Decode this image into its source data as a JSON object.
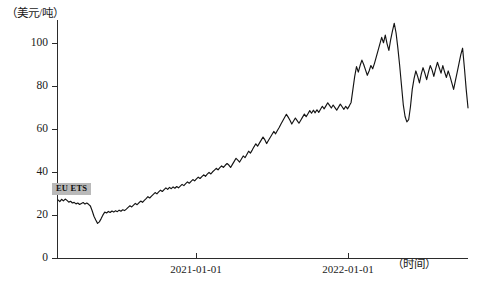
{
  "chart_data": {
    "type": "line",
    "title": "",
    "subtitle": "",
    "xlabel": "（时间）",
    "ylabel": "（美元/吨）",
    "grid": false,
    "legend_position": "inline-label",
    "series_label": "EU ETS",
    "ylim": [
      0,
      110
    ],
    "yticks": [
      0,
      20,
      40,
      60,
      80,
      100
    ],
    "ytick_labels": [
      "0",
      "20",
      "40",
      "60",
      "80",
      "100"
    ],
    "xlim": [
      "2020-07-01",
      "2022-10-15"
    ],
    "xticks": [
      "2021-01-01",
      "2022-01-01"
    ],
    "xtick_labels": [
      "2021-01-01",
      "2022-01-01"
    ],
    "colors": {
      "line": "#141414",
      "axis": "#2b2b2b",
      "badge_background": "#b9b9b9",
      "background": "#ffffff"
    },
    "series": [
      {
        "name": "EU ETS",
        "x": [
          0,
          1,
          2,
          3,
          4,
          5,
          6,
          7,
          8,
          9,
          10,
          11,
          12,
          13,
          14,
          15,
          16,
          17,
          18,
          19,
          20,
          21,
          22,
          23,
          24,
          25,
          26,
          27,
          28,
          29,
          30,
          31,
          32,
          33,
          34,
          35,
          36,
          37,
          38,
          39,
          40,
          41,
          42,
          43,
          44,
          45,
          46,
          47,
          48,
          49,
          50,
          51,
          52,
          53,
          54,
          55,
          56,
          57,
          58,
          59,
          60,
          61,
          62,
          63,
          64,
          65,
          66,
          67,
          68,
          69,
          70,
          71,
          72,
          73,
          74,
          75,
          76,
          77,
          78,
          79,
          80,
          81,
          82,
          83,
          84,
          85,
          86,
          87,
          88,
          89,
          90,
          91,
          92,
          93,
          94,
          95,
          96,
          97,
          98,
          99,
          100,
          101,
          102,
          103,
          104,
          105,
          106,
          107,
          108,
          109,
          110,
          111,
          112,
          113,
          114,
          115,
          116,
          117,
          118,
          119,
          120,
          121,
          122,
          123,
          124,
          125,
          126,
          127,
          128,
          129,
          130,
          131,
          132,
          133,
          134,
          135,
          136,
          137,
          138,
          139,
          140,
          141,
          142,
          143,
          144,
          145,
          146,
          147,
          148,
          149,
          150,
          151,
          152,
          153,
          154,
          155,
          156,
          157,
          158,
          159,
          160,
          161,
          162,
          163,
          164,
          165,
          166,
          167,
          168,
          169,
          170,
          171,
          172,
          173,
          174,
          175,
          176,
          177,
          178,
          179,
          180,
          181,
          182,
          183,
          184,
          185,
          186,
          187,
          188,
          189,
          190,
          191,
          192,
          193,
          194,
          195
        ],
        "values": [
          27.0,
          26.2,
          27.3,
          26.6,
          27.4,
          26.8,
          26.0,
          26.4,
          25.6,
          25.9,
          25.2,
          25.6,
          24.9,
          25.4,
          25.8,
          25.1,
          25.6,
          25.0,
          24.2,
          22.0,
          19.5,
          17.8,
          16.2,
          16.9,
          18.4,
          20.1,
          21.4,
          21.0,
          21.7,
          21.2,
          21.9,
          21.4,
          22.0,
          21.6,
          22.3,
          21.8,
          22.5,
          22.1,
          22.8,
          23.6,
          24.3,
          23.8,
          24.6,
          25.4,
          24.8,
          25.7,
          26.5,
          25.9,
          26.8,
          27.6,
          28.5,
          27.9,
          28.8,
          29.6,
          30.4,
          29.8,
          30.7,
          31.5,
          30.9,
          31.8,
          32.6,
          31.9,
          32.8,
          32.2,
          33.0,
          32.4,
          33.2,
          32.6,
          33.4,
          34.2,
          33.6,
          34.5,
          35.3,
          34.7,
          35.6,
          36.4,
          35.8,
          36.7,
          37.5,
          36.9,
          37.8,
          38.6,
          37.9,
          38.9,
          39.7,
          39.0,
          40.0,
          40.8,
          41.6,
          40.9,
          41.9,
          42.7,
          42.0,
          43.0,
          43.8,
          43.1,
          42.0,
          43.4,
          44.8,
          46.2,
          45.4,
          44.5,
          45.9,
          47.3,
          46.5,
          48.0,
          49.5,
          48.6,
          50.0,
          51.5,
          52.9,
          51.8,
          53.2,
          54.6,
          56.0,
          54.8,
          53.0,
          54.4,
          55.8,
          57.2,
          58.6,
          57.5,
          59.0,
          60.4,
          62.0,
          63.5,
          65.0,
          66.5,
          65.2,
          63.8,
          62.0,
          63.4,
          64.8,
          63.6,
          62.4,
          63.8,
          65.2,
          66.6,
          65.4,
          66.8,
          68.2,
          67.0,
          68.4,
          67.2,
          68.6,
          67.4,
          68.8,
          70.2,
          69.0,
          70.4,
          71.8,
          70.6,
          69.4,
          70.8,
          69.6,
          68.4,
          69.8,
          71.2,
          70.0,
          68.8,
          70.2,
          69.0,
          70.4,
          72.0,
          78.0,
          84.0,
          88.5,
          86.0,
          89.0,
          91.5,
          89.5,
          87.0,
          84.5,
          86.5,
          89.0,
          87.5,
          90.0,
          93.0,
          96.0,
          99.0,
          102.0,
          99.5,
          103.0,
          99.0,
          96.0,
          101.0,
          105.0,
          108.5,
          104.0,
          97.0,
          89.0,
          80.0,
          71.0,
          65.5,
          63.0,
          64.0
        ],
        "annotations": [
          {
            "label": "peak",
            "value": 108.5,
            "date": "2022-02"
          },
          {
            "label": "crash-low",
            "value": 63.0,
            "date": "2022-03"
          },
          {
            "label": "start",
            "value": 27.0,
            "date": "2020-07"
          },
          {
            "label": "early-low",
            "value": 16.2,
            "date": "2020-09"
          },
          {
            "label": "end",
            "value": 69.5,
            "date": "2022-10"
          }
        ]
      },
      {
        "name": "EU ETS (continuation)",
        "x": [
          195,
          196,
          197,
          198,
          199,
          200,
          201,
          202,
          203,
          204,
          205,
          206,
          207,
          208,
          209,
          210,
          211,
          212,
          213,
          214,
          215,
          216,
          217,
          218,
          219,
          220,
          221,
          222,
          223,
          224,
          225,
          226,
          227,
          228
        ],
        "values": [
          64.0,
          70.0,
          78.0,
          83.0,
          86.5,
          84.0,
          81.0,
          85.0,
          88.0,
          85.5,
          82.5,
          86.0,
          89.0,
          87.0,
          84.0,
          87.5,
          90.5,
          88.0,
          85.5,
          89.0,
          86.0,
          83.5,
          86.5,
          84.0,
          81.0,
          78.0,
          82.0,
          86.0,
          90.0,
          94.0,
          97.0,
          88.0,
          78.0,
          69.5
        ]
      }
    ]
  },
  "axes": {
    "y_title": "（美元/吨）",
    "x_title": "（时间）",
    "y_labels": [
      "100",
      "80",
      "60",
      "40",
      "20",
      "0"
    ],
    "x_labels": [
      "2021-01-01",
      "2022-01-01"
    ]
  },
  "badge": {
    "text": "EU ETS"
  }
}
